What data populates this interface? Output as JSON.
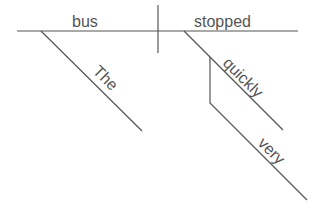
{
  "diagram": {
    "type": "sentence-diagram",
    "sentence": "The bus stopped very quickly",
    "colors": {
      "line": "#555555",
      "text": "#555555",
      "background": "#ffffff"
    },
    "subject": {
      "word": "bus"
    },
    "predicate": {
      "word": "stopped"
    },
    "modifiers": [
      {
        "word": "The",
        "modifies": "bus",
        "role": "article"
      },
      {
        "word": "quickly",
        "modifies": "stopped",
        "role": "adverb"
      },
      {
        "word": "very",
        "modifies": "quickly",
        "role": "adverb"
      }
    ]
  }
}
